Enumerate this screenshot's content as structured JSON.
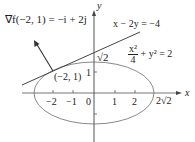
{
  "diagram": {
    "gradient_label": "∇f(−2, 1) = −i + 2j",
    "tangent_line_label": "x − 2y = −4",
    "ellipse_equation": {
      "numerator": "x²",
      "denominator": "4",
      "rest": "+ y² = 2"
    },
    "point_label": "(−2, 1)",
    "y_axis_label": "y",
    "x_axis_label": "x",
    "sqrt2_label": "√2",
    "two_sqrt2_label": "2√2",
    "x_ticks": [
      "−2",
      "−1",
      "0",
      "1",
      "2"
    ],
    "y_ticks": [
      "1"
    ],
    "colors": {
      "ellipse": "#8a8a8a",
      "axis": "#555555",
      "line": "#444444",
      "text": "#222222"
    }
  }
}
